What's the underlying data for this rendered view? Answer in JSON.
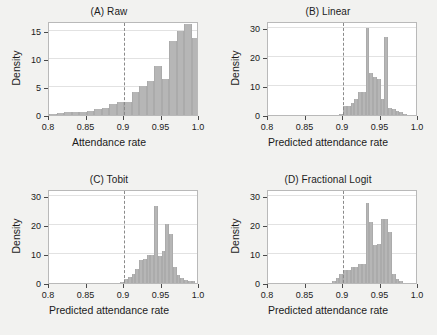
{
  "figure": {
    "background_color": "#f2f2f0",
    "bar_color": "#b6b6b6",
    "refline_color": "#8a8a8a"
  },
  "chart_data": [
    {
      "type": "bar",
      "panel_id": "A",
      "title": "(A) Raw",
      "xlabel": "Attendance rate",
      "ylabel": "Density",
      "xlim": [
        0.8,
        1.0
      ],
      "ylim": [
        0,
        16.8
      ],
      "grid": true,
      "xticks": [
        0.8,
        0.85,
        0.9,
        0.95,
        1.0
      ],
      "xtick_labels": [
        "0.8",
        "0.85",
        "0.9",
        "0.95",
        "1.0"
      ],
      "yticks": [
        0,
        5,
        10,
        15
      ],
      "ytick_labels": [
        "0",
        "5",
        "10",
        "15"
      ],
      "reference_line": 0.9,
      "bin_width": 0.01,
      "bin_starts": [
        0.8,
        0.81,
        0.82,
        0.83,
        0.84,
        0.85,
        0.86,
        0.87,
        0.88,
        0.89,
        0.9,
        0.91,
        0.92,
        0.93,
        0.94,
        0.95,
        0.96,
        0.97,
        0.98,
        0.99
      ],
      "values": [
        0.2,
        0.35,
        0.5,
        0.5,
        0.55,
        0.7,
        1.0,
        1.3,
        1.9,
        2.3,
        2.3,
        4.1,
        5.2,
        6.0,
        8.7,
        6.5,
        13.2,
        15.0,
        16.2,
        13.8
      ]
    },
    {
      "type": "bar",
      "panel_id": "B",
      "title": "(B) Linear",
      "xlabel": "Predicted attendance rate",
      "ylabel": "Density",
      "xlim": [
        0.8,
        1.0
      ],
      "ylim": [
        0,
        32.5
      ],
      "grid": true,
      "xticks": [
        0.8,
        0.85,
        0.9,
        0.95,
        1.0
      ],
      "xtick_labels": [
        "0.8",
        "0.85",
        "0.9",
        "0.95",
        "1.0"
      ],
      "yticks": [
        0,
        10,
        20,
        30
      ],
      "ytick_labels": [
        "0",
        "10",
        "20",
        "30"
      ],
      "reference_line": 0.9,
      "bin_width": 0.005,
      "bin_starts": [
        0.895,
        0.9,
        0.905,
        0.91,
        0.915,
        0.92,
        0.925,
        0.93,
        0.935,
        0.94,
        0.945,
        0.95,
        0.955,
        0.96,
        0.965,
        0.97,
        0.975,
        0.98
      ],
      "values": [
        0.4,
        3.0,
        3.1,
        4.2,
        5.4,
        7.8,
        8.0,
        30.2,
        14.6,
        13.0,
        12.6,
        5.5,
        27.0,
        2.4,
        2.0,
        1.4,
        1.2,
        0.4
      ]
    },
    {
      "type": "bar",
      "panel_id": "C",
      "title": "(C) Tobit",
      "xlabel": "Predicted attendance rate",
      "ylabel": "Density",
      "xlim": [
        0.8,
        1.0
      ],
      "ylim": [
        0,
        32.5
      ],
      "grid": true,
      "xticks": [
        0.8,
        0.85,
        0.9,
        0.95,
        1.0
      ],
      "xtick_labels": [
        "0.8",
        "0.85",
        "0.9",
        "0.95",
        "1.0"
      ],
      "yticks": [
        0,
        10,
        20,
        30
      ],
      "ytick_labels": [
        "0",
        "10",
        "20",
        "30"
      ],
      "reference_line": 0.9,
      "bin_width": 0.005,
      "bin_starts": [
        0.895,
        0.9,
        0.905,
        0.91,
        0.915,
        0.92,
        0.925,
        0.93,
        0.935,
        0.94,
        0.945,
        0.95,
        0.955,
        0.96,
        0.965,
        0.97,
        0.975,
        0.98,
        0.985,
        0.99
      ],
      "values": [
        0.3,
        1.5,
        2.2,
        3.2,
        5.0,
        8.0,
        8.2,
        9.6,
        9.6,
        26.7,
        9.4,
        11.0,
        20.5,
        17.0,
        5.4,
        2.6,
        1.8,
        1.0,
        0.6,
        0.8
      ]
    },
    {
      "type": "bar",
      "panel_id": "D",
      "title": "(D) Fractional Logit",
      "xlabel": "Predicted attendance rate",
      "ylabel": "Density",
      "xlim": [
        0.8,
        1.0
      ],
      "ylim": [
        0,
        32.5
      ],
      "grid": true,
      "xticks": [
        0.8,
        0.85,
        0.9,
        0.95,
        1.0
      ],
      "xtick_labels": [
        "0.8",
        "0.85",
        "0.9",
        "0.95",
        "1.0"
      ],
      "yticks": [
        0,
        10,
        20,
        30
      ],
      "ytick_labels": [
        "0",
        "10",
        "20",
        "30"
      ],
      "reference_line": 0.9,
      "bin_width": 0.005,
      "bin_starts": [
        0.885,
        0.89,
        0.895,
        0.9,
        0.905,
        0.91,
        0.915,
        0.92,
        0.925,
        0.93,
        0.935,
        0.94,
        0.945,
        0.95,
        0.955,
        0.96,
        0.965,
        0.97,
        0.975
      ],
      "values": [
        0.6,
        1.6,
        3.0,
        4.6,
        4.6,
        5.4,
        5.4,
        6.6,
        6.6,
        27.5,
        21.0,
        13.2,
        13.4,
        22.0,
        22.0,
        17.8,
        3.0,
        1.5,
        0.6
      ]
    }
  ]
}
